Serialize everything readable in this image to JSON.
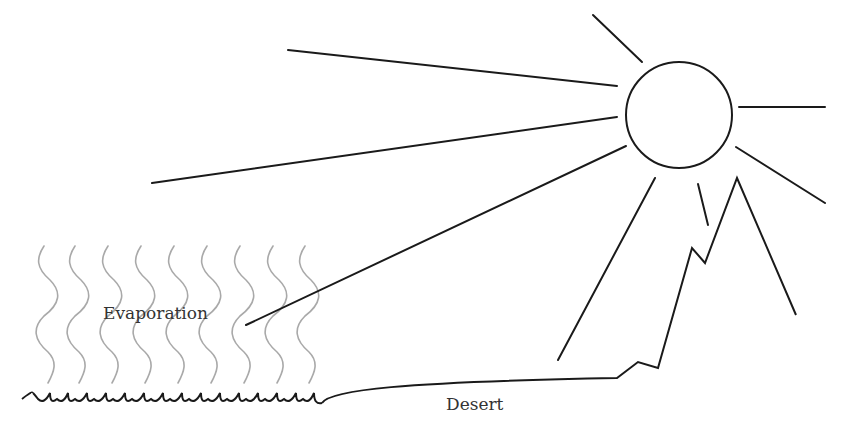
{
  "diagram": {
    "type": "illustration",
    "labels": {
      "evaporation": "Evaporation",
      "desert": "Desert"
    },
    "colors": {
      "line": "#1a1a1a",
      "evaporation_wave": "#a9a9a9",
      "text": "#333333",
      "background": "#ffffff"
    },
    "elements": [
      {
        "id": "sun",
        "shape": "circle",
        "note": "sun drawn as outline circle with radiating rays"
      },
      {
        "id": "sun-rays",
        "count": 8
      },
      {
        "id": "evaporation-waves",
        "count": 9
      },
      {
        "id": "water-surface",
        "shape": "scalloped line"
      },
      {
        "id": "desert-ground",
        "shape": "line"
      },
      {
        "id": "mountain",
        "shape": "jagged polyline"
      }
    ]
  }
}
